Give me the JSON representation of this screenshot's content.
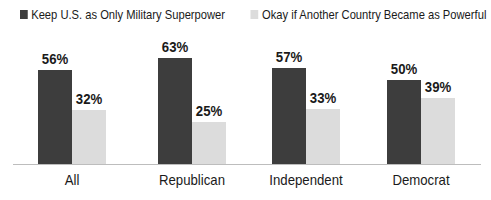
{
  "legend": [
    {
      "label": "Keep U.S. as Only Military Superpower",
      "color": "#3d3d3d"
    },
    {
      "label": "Okay if Another Country Became as Powerful",
      "color": "#dcdcdc"
    }
  ],
  "chart_data": {
    "type": "bar",
    "title": "",
    "xlabel": "",
    "ylabel": "",
    "categories": [
      "All",
      "Republican",
      "Independent",
      "Democrat"
    ],
    "series": [
      {
        "name": "Keep U.S. as Only Military Superpower",
        "values": [
          56,
          63,
          57,
          50
        ],
        "labels": [
          "56%",
          "63%",
          "57%",
          "50%"
        ],
        "color": "#3d3d3d"
      },
      {
        "name": "Okay if Another Country Became as Powerful",
        "values": [
          32,
          25,
          33,
          39
        ],
        "labels": [
          "32%",
          "25%",
          "33%",
          "39%"
        ],
        "color": "#dcdcdc"
      }
    ],
    "ylim": [
      0,
      100
    ],
    "grid": false,
    "legend_position": "top"
  }
}
